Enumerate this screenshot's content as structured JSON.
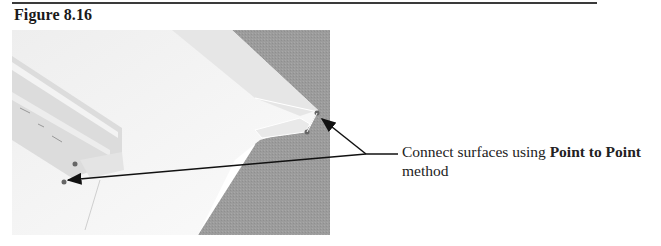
{
  "page": {
    "figure_label": "Figure 8.16",
    "callout": {
      "text_prefix": "Connect surfaces using ",
      "bold_text": "Point to Point",
      "text_suffix": "method"
    },
    "image": {
      "description": "3D CAD model of two parallel sheet-metal flange surfaces with point-to-point connection markers",
      "background_gray": "#9a9a9a",
      "surface_light": "#f4f4f4",
      "surface_mid": "#dedede"
    }
  }
}
